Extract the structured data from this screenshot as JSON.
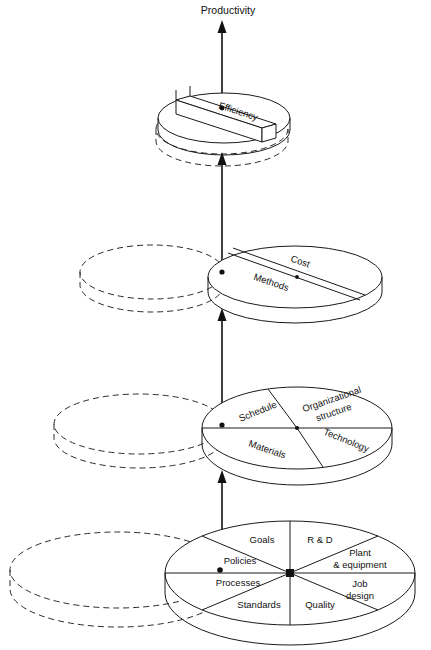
{
  "diagram": {
    "title": "Productivity",
    "type": "stacked-disk-hierarchy",
    "arrow_direction": "upward",
    "colors": {
      "stroke": "#1a1a1a",
      "dashed_stroke": "#2b2b2b",
      "background": "#ffffff",
      "marker": "#111111"
    },
    "levels": [
      {
        "index": 1,
        "name": "efficiency-disk",
        "sector_count": 1,
        "sectors": [
          {
            "label": "Efficiency",
            "name": "sector-efficiency"
          }
        ]
      },
      {
        "index": 2,
        "name": "methods-cost-disk",
        "sector_count": 2,
        "sectors": [
          {
            "label": "Cost",
            "name": "sector-cost"
          },
          {
            "label": "Methods",
            "name": "sector-methods"
          }
        ]
      },
      {
        "index": 3,
        "name": "resources-disk",
        "sector_count": 4,
        "sectors": [
          {
            "label": "Schedule",
            "name": "sector-schedule"
          },
          {
            "label": "Organizational",
            "label2": "structure",
            "name": "sector-organizational-structure"
          },
          {
            "label": "Technology",
            "name": "sector-technology"
          },
          {
            "label": "Materials",
            "name": "sector-materials"
          }
        ]
      },
      {
        "index": 4,
        "name": "foundation-disk",
        "sector_count": 8,
        "sectors": [
          {
            "label": "Goals",
            "name": "sector-goals"
          },
          {
            "label": "R & D",
            "name": "sector-r-and-d"
          },
          {
            "label": "Plant",
            "label2": "& equipment",
            "name": "sector-plant-equipment"
          },
          {
            "label": "Job",
            "label2": "design",
            "name": "sector-job-design"
          },
          {
            "label": "Quality",
            "name": "sector-quality"
          },
          {
            "label": "Standards",
            "name": "sector-standards"
          },
          {
            "label": "Processes",
            "name": "sector-processes"
          },
          {
            "label": "Policies",
            "name": "sector-policies"
          }
        ]
      }
    ]
  }
}
